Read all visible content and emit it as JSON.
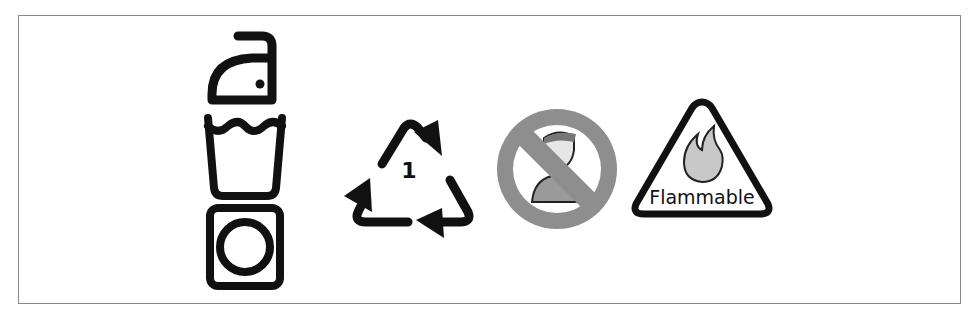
{
  "figure": {
    "symbols": [
      {
        "name": "iron-wash-dry-care-label",
        "parts": [
          "iron",
          "wash-tub",
          "tumble-dry"
        ]
      },
      {
        "name": "recycling-symbol",
        "code": "1"
      },
      {
        "name": "prohibition-sign",
        "subject": "person"
      },
      {
        "name": "flammable-warning",
        "label": "Flammable"
      }
    ]
  },
  "colors": {
    "ink": "#111111",
    "prohibition_gray": "#8e8e8e",
    "frame": "#8a8a8a"
  }
}
